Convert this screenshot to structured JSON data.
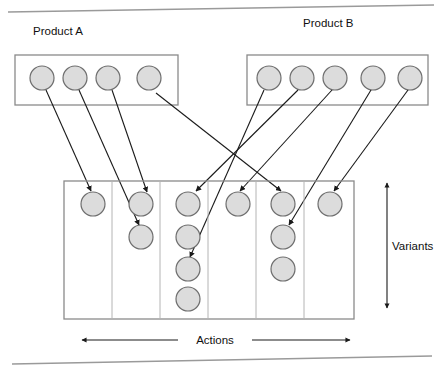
{
  "figure": {
    "title_a": "Product A",
    "title_b": "Product B",
    "dimension_vertical": "Variants",
    "dimension_horizontal": "Actions"
  },
  "colors": {
    "circle_fill": "#dcdcdc",
    "circle_stroke": "#6e6e6e",
    "box_stroke": "#8a8a8a",
    "arrow_stroke": "#1a1a1a",
    "rule_stroke": "#9a9a9a",
    "text": "#101010"
  },
  "product_a": {
    "label": "Product A",
    "box": {
      "x": 15,
      "y": 55,
      "width": 163,
      "height": 50
    },
    "nodes": [
      {
        "id": "a1",
        "cx": 42,
        "cy": 78,
        "r": 12
      },
      {
        "id": "a2",
        "cx": 75,
        "cy": 78,
        "r": 12
      },
      {
        "id": "a3",
        "cx": 108,
        "cy": 78,
        "r": 12
      },
      {
        "id": "a4",
        "cx": 149,
        "cy": 78,
        "r": 12
      }
    ]
  },
  "product_b": {
    "label": "Product B",
    "box": {
      "x": 247,
      "y": 55,
      "width": 181,
      "height": 50
    },
    "nodes": [
      {
        "id": "b1",
        "cx": 269,
        "cy": 78,
        "r": 12
      },
      {
        "id": "b2",
        "cx": 302,
        "cy": 78,
        "r": 12
      },
      {
        "id": "b3",
        "cx": 335,
        "cy": 78,
        "r": 12
      },
      {
        "id": "b4",
        "cx": 373,
        "cy": 78,
        "r": 12
      },
      {
        "id": "b5",
        "cx": 410,
        "cy": 78,
        "r": 12
      }
    ]
  },
  "grid": {
    "box": {
      "x": 64,
      "y": 181,
      "width": 290,
      "height": 138
    },
    "column_dividers": [
      112,
      160,
      208,
      256,
      304
    ],
    "columns": [
      {
        "index": 1,
        "circle_count": 1,
        "cx": 93,
        "circles": [
          {
            "cy": 204
          }
        ]
      },
      {
        "index": 2,
        "circle_count": 2,
        "cx": 141,
        "circles": [
          {
            "cy": 204
          },
          {
            "cy": 237
          }
        ]
      },
      {
        "index": 3,
        "circle_count": 4,
        "cx": 188,
        "circles": [
          {
            "cy": 204
          },
          {
            "cy": 237
          },
          {
            "cy": 269
          },
          {
            "cy": 299
          }
        ]
      },
      {
        "index": 4,
        "circle_count": 1,
        "cx": 238,
        "circles": [
          {
            "cy": 204
          }
        ]
      },
      {
        "index": 5,
        "circle_count": 3,
        "cx": 283,
        "circles": [
          {
            "cy": 204
          },
          {
            "cy": 237
          },
          {
            "cy": 269
          }
        ]
      },
      {
        "index": 6,
        "circle_count": 1,
        "cx": 330,
        "circles": [
          {
            "cy": 204
          }
        ]
      }
    ],
    "circle_radius": 12
  },
  "connections": [
    {
      "from": "a1",
      "to_col": 1,
      "to_row": 1,
      "x1": 46,
      "y1": 90,
      "x2": 91,
      "y2": 191
    },
    {
      "from": "a2",
      "to_col": 2,
      "to_row": 2,
      "x1": 79,
      "y1": 90,
      "x2": 139,
      "y2": 225
    },
    {
      "from": "a3",
      "to_col": 2,
      "to_row": 1,
      "x1": 112,
      "y1": 90,
      "x2": 147,
      "y2": 192
    },
    {
      "from": "a4",
      "to_col": 5,
      "to_row": 1,
      "x1": 156,
      "y1": 93,
      "x2": 281,
      "y2": 191
    },
    {
      "from": "b1",
      "to_col": 3,
      "to_row": 4,
      "x1": 264,
      "y1": 90,
      "x2": 190,
      "y2": 257
    },
    {
      "from": "b2",
      "to_col": 3,
      "to_row": 1,
      "x1": 298,
      "y1": 90,
      "x2": 196,
      "y2": 191
    },
    {
      "from": "b3",
      "to_col": 4,
      "to_row": 1,
      "x1": 332,
      "y1": 90,
      "x2": 240,
      "y2": 191
    },
    {
      "from": "b4",
      "to_col": 5,
      "to_row": 2,
      "x1": 371,
      "y1": 90,
      "x2": 289,
      "y2": 225
    },
    {
      "from": "b5",
      "to_col": 6,
      "to_row": 1,
      "x1": 408,
      "y1": 90,
      "x2": 334,
      "y2": 191
    }
  ],
  "dimension_arrows": {
    "vertical": {
      "label": "Variants",
      "x": 387,
      "y_top": 183,
      "y_bottom": 308,
      "label_x": 392,
      "label_y": 248
    },
    "horizontal": {
      "label": "Actions",
      "y": 340,
      "x_left": 82,
      "x_right": 350,
      "label_x": 216,
      "label_y": 344
    }
  },
  "rules": [
    {
      "name": "top-rule",
      "x1": 8,
      "y1": 12,
      "x2": 434,
      "y2": 5
    },
    {
      "name": "bottom-rule",
      "x1": 12,
      "y1": 364,
      "x2": 432,
      "y2": 356
    }
  ]
}
